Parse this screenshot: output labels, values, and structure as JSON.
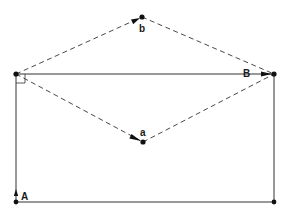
{
  "diagram": {
    "type": "vector-diagram",
    "colors": {
      "line": "#333333",
      "point": "#111111",
      "background": "#ffffff"
    },
    "points": [
      {
        "id": "top-left",
        "label": ""
      },
      {
        "id": "top-right",
        "label": ""
      },
      {
        "id": "bottom-left",
        "label": ""
      },
      {
        "id": "bottom-right",
        "label": ""
      },
      {
        "id": "b",
        "label": "b"
      },
      {
        "id": "a",
        "label": "a"
      }
    ],
    "labels": {
      "A": "A",
      "B": "B",
      "a": "a",
      "b": "b"
    },
    "edges": [
      {
        "from": "top-left",
        "to": "top-right",
        "style": "solid",
        "arrow": true,
        "label": "B"
      },
      {
        "from": "bottom-left",
        "to": "top-left",
        "style": "solid",
        "arrow": true,
        "label": "A"
      },
      {
        "from": "bottom-left",
        "to": "bottom-right",
        "style": "solid",
        "arrow": false,
        "label": ""
      },
      {
        "from": "bottom-right",
        "to": "top-right",
        "style": "solid",
        "arrow": false,
        "label": ""
      },
      {
        "from": "top-left",
        "to": "b",
        "style": "dashed",
        "arrow": true,
        "label": "b"
      },
      {
        "from": "b",
        "to": "top-right",
        "style": "dashed",
        "arrow": false,
        "label": ""
      },
      {
        "from": "top-left",
        "to": "a",
        "style": "dashed",
        "arrow": true,
        "label": "a"
      },
      {
        "from": "a",
        "to": "top-right",
        "style": "dashed",
        "arrow": false,
        "label": ""
      }
    ],
    "right_angle_marker": "top-left"
  }
}
